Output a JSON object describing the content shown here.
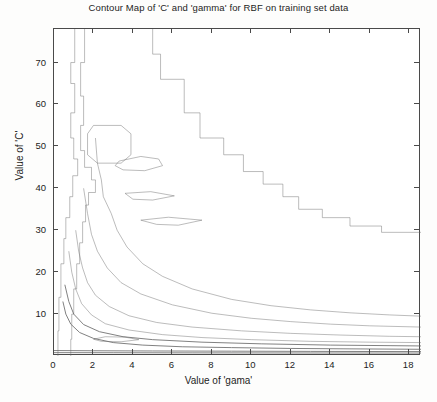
{
  "chart_data": {
    "type": "contour",
    "title": "Contour Map of 'C' and 'gamma' for RBF on training set data",
    "xlabel": "Value of 'gama'",
    "ylabel": "Value of 'C'",
    "xlim": [
      0,
      18.6
    ],
    "ylim": [
      0,
      78
    ],
    "xticks": [
      0,
      2,
      4,
      6,
      8,
      10,
      12,
      14,
      16,
      18
    ],
    "yticks": [
      10,
      20,
      30,
      40,
      50,
      60,
      70
    ],
    "grid": false,
    "legend": "none",
    "line_color": "#6b6b6b",
    "background": "#ffffff",
    "contours": [
      {
        "level": "outer-staircase",
        "points": [
          [
            5.0,
            78
          ],
          [
            5.0,
            72
          ],
          [
            5.4,
            72
          ],
          [
            5.4,
            66
          ],
          [
            6.6,
            66
          ],
          [
            6.6,
            58
          ],
          [
            7.4,
            58
          ],
          [
            7.4,
            52
          ],
          [
            8.6,
            52
          ],
          [
            8.6,
            48
          ],
          [
            9.6,
            48
          ],
          [
            9.6,
            44
          ],
          [
            10.6,
            44
          ],
          [
            10.6,
            41
          ],
          [
            11.6,
            41
          ],
          [
            11.6,
            38
          ],
          [
            12.4,
            38
          ],
          [
            12.4,
            35
          ],
          [
            13.6,
            35
          ],
          [
            13.6,
            33
          ],
          [
            15.0,
            33
          ],
          [
            15.0,
            31
          ],
          [
            16.6,
            31
          ],
          [
            16.6,
            29.5
          ],
          [
            18.6,
            29.5
          ]
        ]
      },
      {
        "level": "left-vertical-1",
        "points": [
          [
            1.05,
            78
          ],
          [
            1.05,
            70
          ],
          [
            0.85,
            70
          ],
          [
            0.85,
            65
          ],
          [
            1.05,
            65
          ],
          [
            1.05,
            58
          ],
          [
            0.85,
            58
          ],
          [
            0.85,
            52
          ],
          [
            1.0,
            52
          ],
          [
            1.0,
            47
          ],
          [
            1.2,
            47
          ],
          [
            1.2,
            43
          ],
          [
            0.95,
            43
          ],
          [
            0.95,
            38
          ],
          [
            0.8,
            38
          ],
          [
            0.8,
            33
          ],
          [
            0.6,
            33
          ],
          [
            0.6,
            28
          ],
          [
            0.5,
            28
          ],
          [
            0.5,
            22
          ],
          [
            0.35,
            22
          ],
          [
            0.35,
            14
          ],
          [
            0.25,
            14
          ],
          [
            0.25,
            6
          ],
          [
            0.2,
            6
          ],
          [
            0.2,
            0
          ]
        ]
      },
      {
        "level": "left-vertical-2",
        "points": [
          [
            1.55,
            78
          ],
          [
            1.55,
            70
          ],
          [
            1.35,
            70
          ],
          [
            1.35,
            62
          ],
          [
            1.5,
            62
          ],
          [
            1.5,
            55
          ],
          [
            1.35,
            55
          ],
          [
            1.35,
            49
          ],
          [
            1.55,
            49
          ],
          [
            1.55,
            45
          ],
          [
            1.9,
            45
          ],
          [
            1.9,
            42
          ],
          [
            2.1,
            42
          ],
          [
            2.1,
            39
          ],
          [
            1.75,
            39
          ],
          [
            1.75,
            36
          ],
          [
            1.6,
            36
          ],
          [
            1.6,
            32
          ],
          [
            1.45,
            32
          ],
          [
            1.45,
            27
          ],
          [
            1.3,
            27
          ],
          [
            1.3,
            22
          ],
          [
            1.15,
            22
          ],
          [
            1.15,
            16
          ],
          [
            1.0,
            16
          ],
          [
            1.0,
            10
          ],
          [
            0.9,
            10
          ],
          [
            0.9,
            4
          ],
          [
            0.85,
            4
          ],
          [
            0.85,
            0
          ]
        ]
      },
      {
        "level": "pocket-hexagon",
        "points": [
          [
            1.7,
            53
          ],
          [
            2.0,
            55
          ],
          [
            3.4,
            55
          ],
          [
            3.9,
            53
          ],
          [
            3.9,
            48
          ],
          [
            3.4,
            46
          ],
          [
            2.2,
            46
          ],
          [
            1.7,
            48
          ]
        ]
      },
      {
        "level": "island-a",
        "points": [
          [
            3.3,
            46.5
          ],
          [
            4.4,
            47.6
          ],
          [
            5.3,
            47.0
          ],
          [
            5.5,
            45.4
          ],
          [
            4.6,
            44.2
          ],
          [
            3.5,
            44.4
          ],
          [
            3.1,
            45.4
          ]
        ]
      },
      {
        "level": "island-b",
        "points": [
          [
            3.6,
            38.8
          ],
          [
            4.9,
            39.2
          ],
          [
            6.1,
            38.2
          ],
          [
            5.0,
            37.2
          ],
          [
            4.0,
            37.4
          ]
        ]
      },
      {
        "level": "island-c",
        "points": [
          [
            4.4,
            32.4
          ],
          [
            5.8,
            33.1
          ],
          [
            7.5,
            32.4
          ],
          [
            6.3,
            31.2
          ],
          [
            5.2,
            31.4
          ]
        ]
      },
      {
        "level": "mid-curve-1",
        "points": [
          [
            2.1,
            52
          ],
          [
            2.2,
            46
          ],
          [
            2.4,
            42
          ],
          [
            2.5,
            38
          ],
          [
            2.9,
            34
          ],
          [
            3.2,
            30
          ],
          [
            3.7,
            26
          ],
          [
            4.5,
            22
          ],
          [
            5.5,
            19
          ],
          [
            7.0,
            16
          ],
          [
            9.0,
            13.5
          ],
          [
            11.0,
            12
          ],
          [
            13.0,
            11
          ],
          [
            15.0,
            10.3
          ],
          [
            17.0,
            9.8
          ],
          [
            18.6,
            9.5
          ]
        ]
      },
      {
        "level": "mid-curve-2",
        "points": [
          [
            1.5,
            40
          ],
          [
            1.7,
            34
          ],
          [
            1.9,
            29
          ],
          [
            2.2,
            25
          ],
          [
            2.7,
            21
          ],
          [
            3.4,
            17.5
          ],
          [
            4.4,
            14.8
          ],
          [
            6.0,
            12.2
          ],
          [
            8.0,
            10.2
          ],
          [
            10.0,
            9.0
          ],
          [
            12.0,
            8.2
          ],
          [
            14.0,
            7.6
          ],
          [
            16.0,
            7.2
          ],
          [
            18.6,
            6.9
          ]
        ]
      },
      {
        "level": "mid-curve-3",
        "points": [
          [
            1.1,
            30
          ],
          [
            1.25,
            25
          ],
          [
            1.45,
            21
          ],
          [
            1.7,
            17.5
          ],
          [
            2.1,
            14.5
          ],
          [
            2.8,
            11.8
          ],
          [
            3.8,
            9.6
          ],
          [
            5.2,
            8.0
          ],
          [
            7.0,
            6.9
          ],
          [
            9.5,
            6.0
          ],
          [
            12.0,
            5.4
          ],
          [
            14.5,
            5.0
          ],
          [
            17.0,
            4.7
          ],
          [
            18.6,
            4.6
          ]
        ]
      },
      {
        "level": "mid-curve-4",
        "points": [
          [
            0.75,
            25
          ],
          [
            0.9,
            20
          ],
          [
            1.1,
            16
          ],
          [
            1.4,
            12.5
          ],
          [
            1.9,
            9.8
          ],
          [
            2.6,
            7.7
          ],
          [
            3.8,
            6.2
          ],
          [
            5.5,
            5.1
          ],
          [
            7.5,
            4.4
          ],
          [
            10.0,
            3.9
          ],
          [
            13.0,
            3.5
          ],
          [
            16.0,
            3.3
          ],
          [
            18.6,
            3.2
          ]
        ]
      },
      {
        "level": "inner-curve-dark",
        "points": [
          [
            0.45,
            13
          ],
          [
            0.6,
            10
          ],
          [
            0.85,
            7.6
          ],
          [
            1.3,
            5.6
          ],
          [
            2.0,
            4.2
          ],
          [
            3.0,
            3.2
          ],
          [
            4.5,
            2.6
          ],
          [
            6.5,
            2.2
          ],
          [
            9.0,
            2.0
          ],
          [
            12.0,
            1.8
          ],
          [
            15.0,
            1.7
          ],
          [
            18.6,
            1.6
          ]
        ]
      },
      {
        "level": "inner-curve-dark-2",
        "points": [
          [
            0.55,
            17
          ],
          [
            0.75,
            13
          ],
          [
            1.0,
            10
          ],
          [
            1.5,
            7.5
          ],
          [
            2.3,
            5.8
          ],
          [
            3.5,
            4.6
          ],
          [
            5.0,
            3.9
          ],
          [
            7.5,
            3.3
          ],
          [
            10.5,
            2.9
          ],
          [
            14.0,
            2.6
          ],
          [
            18.6,
            2.4
          ]
        ]
      },
      {
        "level": "bottom-flat-1",
        "points": [
          [
            0.0,
            1.3
          ],
          [
            2.0,
            1.25
          ],
          [
            5.0,
            1.2
          ],
          [
            9.0,
            1.15
          ],
          [
            13.0,
            1.1
          ],
          [
            18.6,
            1.05
          ]
        ]
      },
      {
        "level": "bottom-flat-2",
        "points": [
          [
            0.0,
            0.8
          ],
          [
            3.0,
            0.78
          ],
          [
            7.0,
            0.75
          ],
          [
            12.0,
            0.72
          ],
          [
            18.6,
            0.7
          ]
        ]
      },
      {
        "level": "small-notch",
        "points": [
          [
            2.0,
            4.0
          ],
          [
            2.6,
            4.6
          ],
          [
            3.6,
            4.5
          ],
          [
            4.3,
            3.9
          ],
          [
            3.4,
            3.4
          ],
          [
            2.4,
            3.5
          ]
        ]
      }
    ]
  },
  "axes": {
    "title": "Contour Map of 'C' and 'gamma' for RBF on training set data",
    "xlabel": "Value of 'gama'",
    "ylabel": "Value of 'C'",
    "xticks": [
      "0",
      "2",
      "4",
      "6",
      "8",
      "10",
      "12",
      "14",
      "16",
      "18"
    ],
    "yticks": [
      "10",
      "20",
      "30",
      "40",
      "50",
      "60",
      "70"
    ]
  }
}
